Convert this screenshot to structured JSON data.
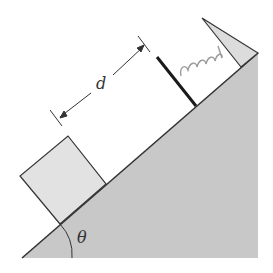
{
  "diagram": {
    "labels": {
      "distance": "d",
      "angle": "θ"
    },
    "colors": {
      "incline_fill": "#c8c8c8",
      "block_fill": "#e2e2e2",
      "stop_fill": "#dcdcdc",
      "line": "#333333",
      "spring": "#9a9a9a",
      "plate": "#1a1a1a"
    },
    "elements": [
      "incline",
      "block",
      "spring",
      "plate",
      "wall-stop",
      "distance-marker",
      "angle-arc"
    ]
  }
}
